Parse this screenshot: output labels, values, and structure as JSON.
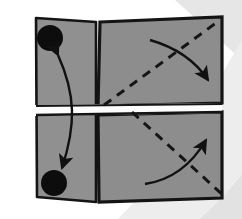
{
  "figure": {
    "title": "Paper folding diagram: two hinged gray panels",
    "width": 242,
    "height": 219,
    "background_color": "#ffffff",
    "corner_band_color": "#e4e4e4",
    "corner_band_color_2": "#ededed"
  },
  "colors": {
    "panel_fill": "#8d8d8d",
    "panel_fill_shadow": "#7e7e7e",
    "back_layer_fill": "#909090",
    "outline": "#141414",
    "dot_fill": "#0d0d0d",
    "arrow_stroke": "#111111",
    "crease_gap": "#fcfcfc",
    "dashed_stroke": "#151515"
  },
  "panels": [
    {
      "name": "top-panel",
      "label": "Top panel",
      "corners": "100,22 222,17 222,103 98,106"
    },
    {
      "name": "bottom-panel",
      "label": "Bottom panel",
      "corners": "98,115 222,112 222,198 99,202"
    }
  ],
  "back_layer": {
    "name": "back-sheet",
    "label": "Back sheet (offset underlayer)",
    "corners": "36,18 96,22 96,202 37,197"
  },
  "crease": {
    "name": "center-crease",
    "label": "Center crease / hinge gap",
    "y": 110
  },
  "dots": [
    {
      "name": "corner-dot-top",
      "label": "Reference dot (top panel)",
      "cx": 50,
      "cy": 38,
      "r": 13
    },
    {
      "name": "corner-dot-bottom",
      "label": "Reference dot (bottom panel)",
      "cx": 54,
      "cy": 183,
      "r": 13
    }
  ],
  "dashed_lines": [
    {
      "name": "fold-line-top",
      "label": "Valley fold line (top panel)",
      "path": "M 104 105 L 220 20",
      "dash": "9 7"
    },
    {
      "name": "fold-line-bottom",
      "label": "Valley fold line (bottom panel)",
      "path": "M 132 112 L 224 196",
      "dash": "9 7"
    }
  ],
  "arrows": [
    {
      "name": "double-arrow-matching-dots",
      "label": "Double-headed arrow matching the two dots",
      "path": "M 58 55 C 76 95, 76 125, 62 168",
      "heads": "both"
    },
    {
      "name": "fold-arrow-top",
      "label": "Fold direction arrow (top panel, downward-right)",
      "path": "M 150 40 C 178 48, 196 62, 208 80",
      "heads": "end"
    },
    {
      "name": "fold-arrow-bottom",
      "label": "Fold direction arrow (bottom panel, upward-right)",
      "path": "M 145 184 C 172 180, 192 164, 206 140",
      "heads": "end"
    }
  ],
  "caption": ""
}
